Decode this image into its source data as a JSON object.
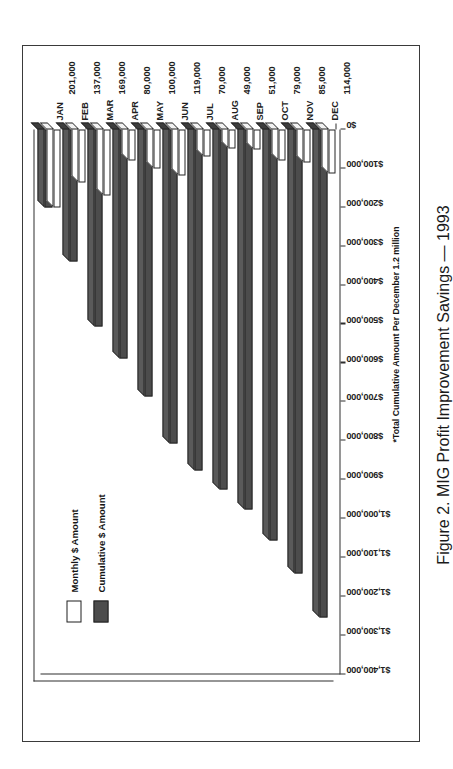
{
  "figure": {
    "caption": "Figure 2. MIG Profit Improvement Savings — 1993",
    "footnote": "*Total Cumulative Amount Per December 1.2 million"
  },
  "legend": {
    "position": "inside-plot-upper-left",
    "items": [
      {
        "label": "Monthly $ Amount",
        "color": "#ffffff",
        "swatch": "white"
      },
      {
        "label": "Cumulative $ Amount",
        "color": "#4c4c4c",
        "swatch": "dark"
      }
    ]
  },
  "axis": {
    "value_axis_labels": [
      "$1,400,000",
      "$1,300,000",
      "$1,200,000",
      "$1,100,000",
      "$1,000,000",
      "$900,000",
      "$800,000",
      "$700,000",
      "$600,000",
      "$500,000",
      "$400,000",
      "$300,000",
      "$200,000",
      "$100,000",
      "$0"
    ],
    "value_axis_ticks": [
      1400000,
      1300000,
      1200000,
      1100000,
      1000000,
      900000,
      800000,
      700000,
      600000,
      500000,
      400000,
      300000,
      200000,
      100000,
      0
    ]
  },
  "chart_data": {
    "type": "bar",
    "orientation": "horizontal-3d",
    "title": "MIG Profit Improvement Savings — 1993",
    "xlabel": "",
    "ylabel": "",
    "categories": [
      "JAN",
      "FEB",
      "MAR",
      "APR",
      "MAY",
      "JUN",
      "JUL",
      "AUG",
      "SEP",
      "OCT",
      "NOV",
      "DEC"
    ],
    "category_value_labels": [
      "201,000",
      "137,000",
      "169,000",
      "80,000",
      "100,000",
      "119,000",
      "70,000",
      "49,000",
      "51,000",
      "79,000",
      "85,000",
      "114,000"
    ],
    "series": [
      {
        "name": "Monthly $ Amount",
        "color": "#ffffff",
        "values": [
          201000,
          137000,
          169000,
          80000,
          100000,
          119000,
          70000,
          49000,
          51000,
          79000,
          85000,
          114000
        ]
      },
      {
        "name": "Cumulative $ Amount",
        "color": "#4c4c4c",
        "values": [
          201000,
          338000,
          507000,
          587000,
          687000,
          806000,
          876000,
          925000,
          976000,
          1055000,
          1140000,
          1254000
        ]
      }
    ],
    "ylim": [
      0,
      1400000
    ],
    "grid": false,
    "tick_labels": [
      "$0",
      "$100,000",
      "$200,000",
      "$300,000",
      "$400,000",
      "$500,000",
      "$600,000",
      "$700,000",
      "$800,000",
      "$900,000",
      "$1,000,000",
      "$1,100,000",
      "$1,200,000",
      "$1,300,000",
      "$1,400,000"
    ],
    "legend_position": "upper-left-inside",
    "annotations": [
      "*Total Cumulative Amount Per December 1.2 million"
    ]
  }
}
